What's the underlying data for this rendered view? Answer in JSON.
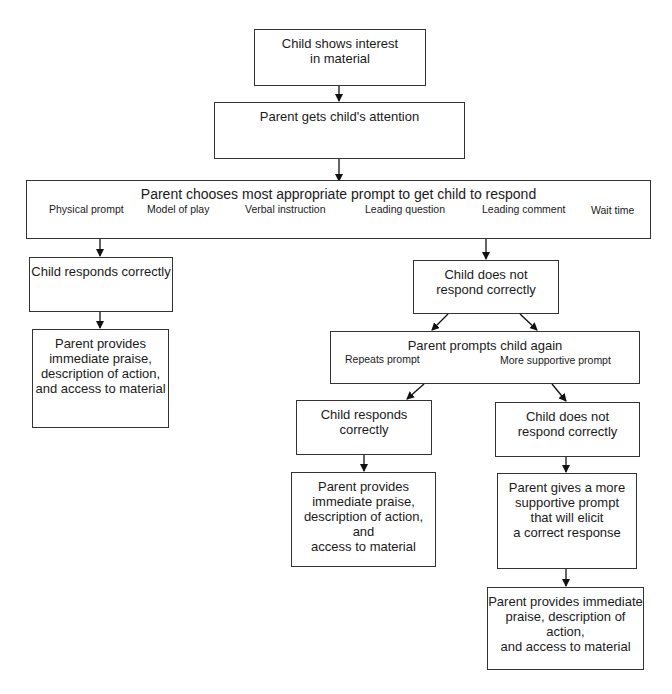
{
  "diagram": {
    "nodes": {
      "interest": {
        "text": "Child shows interest\nin material"
      },
      "attention": {
        "text": "Parent gets child's attention"
      },
      "choose": {
        "text": "Parent chooses most appropriate prompt to get child to respond",
        "options": [
          "Physical prompt",
          "Model of play",
          "Verbal instruction",
          "Leading question",
          "Leading comment",
          "Wait time"
        ]
      },
      "responds_1": {
        "text": "Child responds correctly"
      },
      "praise_1": {
        "text": "Parent provides\nimmediate praise,\ndescription of action,\nand access to material"
      },
      "not_respond_1": {
        "text": "Child does not\nrespond correctly"
      },
      "prompt_again": {
        "text": "Parent prompts child again",
        "options": [
          "Repeats prompt",
          "More supportive prompt"
        ]
      },
      "responds_2": {
        "text": "Child responds\ncorrectly"
      },
      "praise_2": {
        "text": "Parent provides\nimmediate praise,\ndescription of action, and\naccess to material"
      },
      "not_respond_2": {
        "text": "Child does not\nrespond correctly"
      },
      "supportive": {
        "text": "Parent gives a more\nsupportive prompt\nthat will elicit\na correct response"
      },
      "praise_3": {
        "text": "Parent provides immediate\npraise, description of action,\nand access to material"
      }
    },
    "edges": [
      [
        "interest",
        "attention"
      ],
      [
        "attention",
        "choose"
      ],
      [
        "choose",
        "responds_1"
      ],
      [
        "choose",
        "not_respond_1"
      ],
      [
        "responds_1",
        "praise_1"
      ],
      [
        "not_respond_1",
        "prompt_again"
      ],
      [
        "prompt_again",
        "responds_2"
      ],
      [
        "prompt_again",
        "not_respond_2"
      ],
      [
        "responds_2",
        "praise_2"
      ],
      [
        "not_respond_2",
        "supportive"
      ],
      [
        "supportive",
        "praise_3"
      ]
    ]
  }
}
